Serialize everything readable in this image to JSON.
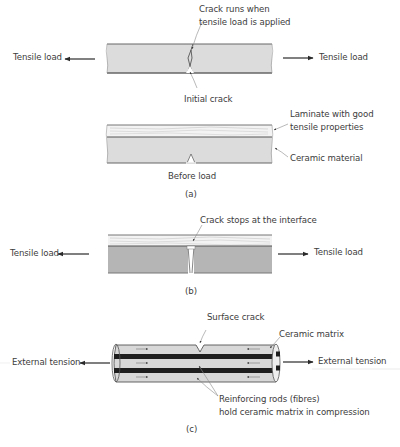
{
  "figure": {
    "panel_a": {
      "caption": "(a)",
      "top": {
        "left_load": "Tensile load",
        "right_load": "Tensile load",
        "crack_runs_line1": "Crack runs when",
        "crack_runs_line2": "tensile load is applied",
        "initial_crack": "Initial crack"
      },
      "bottom": {
        "laminate_line1": "Laminate with good",
        "laminate_line2": "tensile properties",
        "ceramic": "Ceramic material",
        "before_load": "Before load"
      }
    },
    "panel_b": {
      "caption": "(b)",
      "crack_stops": "Crack stops at the interface",
      "left_load": "Tensile load",
      "right_load": "Tensile load"
    },
    "panel_c": {
      "caption": "(c)",
      "surface_crack": "Surface crack",
      "ceramic_matrix": "Ceramic matrix",
      "left_tension": "External tension",
      "right_tension": "External tension",
      "rods_line1": "Reinforcing rods (fibres)",
      "rods_line2": "hold ceramic matrix in compression"
    }
  },
  "colors": {
    "ceramic_light": "#dcdcdc",
    "ceramic_dark": "#b4b4b4",
    "laminate": "#f2f2f2",
    "rod": "#1e1e1e",
    "outline": "#555555",
    "leader": "#8a8a8a"
  }
}
